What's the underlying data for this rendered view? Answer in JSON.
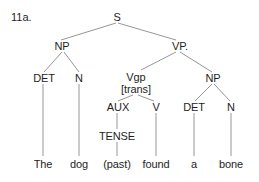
{
  "example_label": "11a.",
  "tree": {
    "root": "S",
    "nodes": {
      "s": "S",
      "np_subject": "NP",
      "vp": "VP.",
      "det_subject": "DET",
      "n_subject": "N",
      "vgp": "Vgp",
      "vgp_feature": "[trans]",
      "np_object": "NP",
      "aux": "AUX",
      "v": "V",
      "det_object": "DET",
      "n_object": "N",
      "tense": "TENSE"
    },
    "words": {
      "the": "The",
      "dog": "dog",
      "past": "(past)",
      "found": "found",
      "a": "a",
      "bone": "bone"
    }
  }
}
